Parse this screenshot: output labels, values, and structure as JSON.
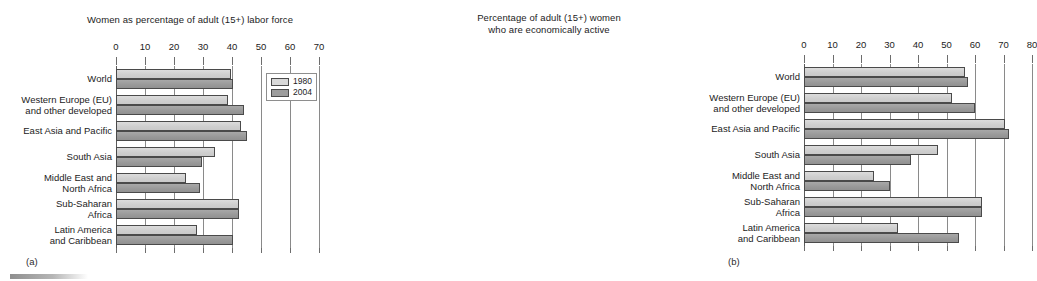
{
  "figure": {
    "subfigure_a_label": "(a)",
    "subfigure_b_label": "(b)"
  },
  "legend": {
    "items": [
      {
        "label": "1980",
        "color": "#d8d8d8"
      },
      {
        "label": "2004",
        "color": "#9c9c9c"
      }
    ]
  },
  "chart_data": [
    {
      "id": "panel-a",
      "type": "bar",
      "orientation": "horizontal",
      "title": "Women as percentage of adult (15+) labor force",
      "title_lines": [
        "Women as percentage of adult (15+) labor force"
      ],
      "xlabel": "",
      "ylabel": "",
      "xlim": [
        0,
        70
      ],
      "xticks": [
        0,
        10,
        20,
        30,
        40,
        50,
        60,
        70
      ],
      "xtick_labels": [
        "0",
        "10",
        "20",
        "30",
        "40",
        "50",
        "60",
        "70"
      ],
      "grid": true,
      "legend_position": "upper right",
      "categories": [
        "World",
        "Western Europe (EU) and other developed",
        "East Asia and Pacific",
        "South Asia",
        "Middle East and North Africa",
        "Sub-Saharan Africa",
        "Latin America and Caribbean"
      ],
      "category_lines": [
        [
          "World"
        ],
        [
          "Western Europe (EU)",
          "and other developed"
        ],
        [
          "East Asia and Pacific"
        ],
        [
          "South Asia"
        ],
        [
          "Middle East and",
          "North Africa"
        ],
        [
          "Sub-Saharan",
          "Africa"
        ],
        [
          "Latin America",
          "and Caribbean"
        ]
      ],
      "series": [
        {
          "name": "1980",
          "color": "#d8d8d8",
          "values": [
            39.5,
            38.5,
            43.0,
            34.0,
            24.0,
            42.5,
            28.0
          ]
        },
        {
          "name": "2004",
          "color": "#9c9c9c",
          "values": [
            40.5,
            44.0,
            45.0,
            29.5,
            29.0,
            42.5,
            40.5
          ]
        }
      ]
    },
    {
      "id": "panel-b",
      "type": "bar",
      "orientation": "horizontal",
      "title": "Percentage of adult (15+) women who are economically active",
      "title_lines": [
        "Percentage of adult (15+) women",
        "who are economically active"
      ],
      "xlabel": "",
      "ylabel": "",
      "xlim": [
        0,
        80
      ],
      "xticks": [
        0,
        10,
        20,
        30,
        40,
        50,
        60,
        70,
        80
      ],
      "xtick_labels": [
        "0",
        "10",
        "20",
        "30",
        "40",
        "50",
        "60",
        "70",
        "80"
      ],
      "grid": true,
      "legend_position": "none",
      "categories": [
        "World",
        "Western Europe (EU) and other developed",
        "East Asia and Pacific",
        "South Asia",
        "Middle East and North Africa",
        "Sub-Saharan Africa",
        "Latin America and Caribbean"
      ],
      "category_lines": [
        [
          "World"
        ],
        [
          "Western Europe (EU)",
          "and other developed"
        ],
        [
          "East Asia and Pacific"
        ],
        [
          "South Asia"
        ],
        [
          "Middle East and",
          "North Africa"
        ],
        [
          "Sub-Saharan",
          "Africa"
        ],
        [
          "Latin America",
          "and Caribbean"
        ]
      ],
      "series": [
        {
          "name": "1980",
          "color": "#d8d8d8",
          "values": [
            56.5,
            52.0,
            70.5,
            47.0,
            24.5,
            62.5,
            33.0
          ]
        },
        {
          "name": "2004",
          "color": "#9c9c9c",
          "values": [
            57.5,
            60.0,
            72.0,
            37.5,
            30.0,
            62.5,
            54.5
          ]
        }
      ]
    }
  ]
}
